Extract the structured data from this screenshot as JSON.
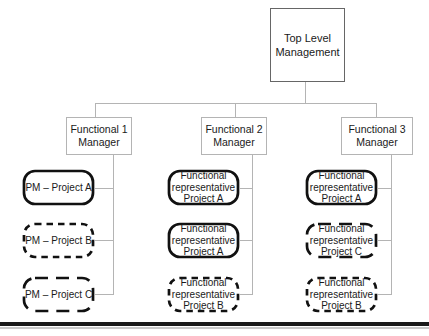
{
  "colors": {
    "background": "#ffffff",
    "connector_line": "#b4b4b4",
    "manager_box_border": "#b4b4b4",
    "top_box_border": "#666666",
    "project_box_border": "#111111",
    "text": "#1a1a1a",
    "bottom_bar": "#1a1a1a"
  },
  "chart": {
    "top_box": "Top Level Management",
    "columns": [
      {
        "manager": "Functional 1 Manager",
        "boxes": [
          {
            "label": "PM – Project A",
            "line_style": "solid"
          },
          {
            "label": "PM – Project B",
            "line_style": "dashed-short"
          },
          {
            "label": "PM – Project C",
            "line_style": "dashed-long"
          }
        ]
      },
      {
        "manager": "Functional 2 Manager",
        "boxes": [
          {
            "label": "Functional representative Project A",
            "line_style": "solid"
          },
          {
            "label": "Functional representative Project A",
            "line_style": "solid"
          },
          {
            "label": "Functional representative Project B",
            "line_style": "dashed-short"
          }
        ]
      },
      {
        "manager": "Functional 3 Manager",
        "boxes": [
          {
            "label": "Functional representative Project A",
            "line_style": "solid"
          },
          {
            "label": "Functional representative Project C",
            "line_style": "dashed-long"
          },
          {
            "label": "Functional representative Project B",
            "line_style": "dashed-short"
          }
        ]
      }
    ]
  }
}
